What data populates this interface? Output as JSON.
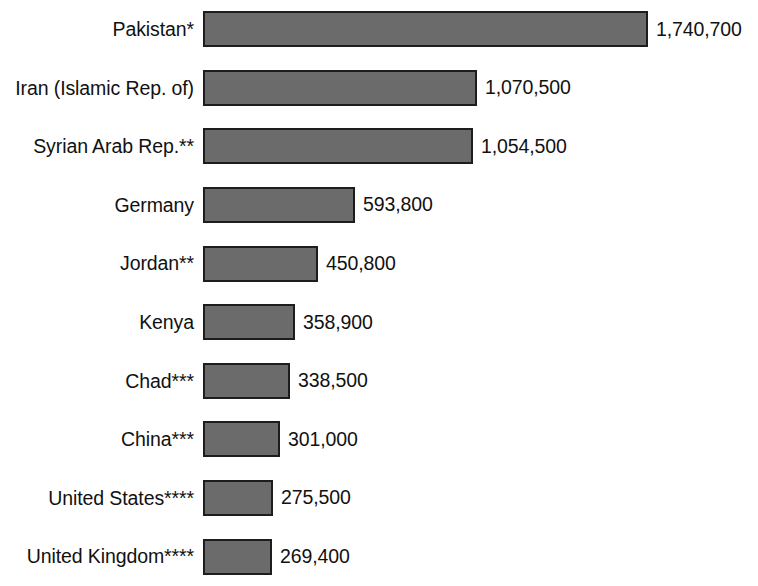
{
  "chart_data": {
    "type": "bar",
    "orientation": "horizontal",
    "title": "",
    "subtitle": "",
    "xlabel": "",
    "ylabel": "",
    "grid": false,
    "legend": false,
    "axis_visible": false,
    "xlim": [
      0,
      1740700
    ],
    "categories": [
      "Pakistan*",
      "Iran (Islamic Rep. of)",
      "Syrian Arab Rep.**",
      "Germany",
      "Jordan**",
      "Kenya",
      "Chad***",
      "China***",
      "United States****",
      "United Kingdom****"
    ],
    "values": [
      1740700,
      1070500,
      1054500,
      593800,
      450800,
      358900,
      338500,
      301000,
      275500,
      269400
    ],
    "value_labels": [
      "1,740,700",
      "1,070,500",
      "1,054,500",
      "593,800",
      "450,800",
      "358,900",
      "338,500",
      "301,000",
      "275,500",
      "269,400"
    ],
    "colors": {
      "bar_fill": "#6b6b6b",
      "bar_border": "#1d1d1d",
      "background": "#ffffff",
      "text": "#111111"
    },
    "rows": [
      {
        "category": "Pakistan*",
        "value": 1740700,
        "value_label": "1,740,700"
      },
      {
        "category": "Iran (Islamic Rep. of)",
        "value": 1070500,
        "value_label": "1,070,500"
      },
      {
        "category": "Syrian Arab Rep.**",
        "value": 1054500,
        "value_label": "1,054,500"
      },
      {
        "category": "Germany",
        "value": 593800,
        "value_label": "593,800"
      },
      {
        "category": "Jordan**",
        "value": 450800,
        "value_label": "450,800"
      },
      {
        "category": "Kenya",
        "value": 358900,
        "value_label": "358,900"
      },
      {
        "category": "Chad***",
        "value": 338500,
        "value_label": "338,500"
      },
      {
        "category": "China***",
        "value": 301000,
        "value_label": "301,000"
      },
      {
        "category": "United States****",
        "value": 275500,
        "value_label": "275,500"
      },
      {
        "category": "United Kingdom****",
        "value": 269400,
        "value_label": "269,400"
      }
    ]
  }
}
